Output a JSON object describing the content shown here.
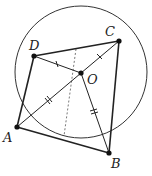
{
  "diagram": {
    "type": "geometry",
    "points": {
      "A": {
        "label": "A",
        "x": 17,
        "y": 127
      },
      "B": {
        "label": "B",
        "x": 109,
        "y": 153
      },
      "C": {
        "label": "C",
        "x": 119,
        "y": 41
      },
      "D": {
        "label": "D",
        "x": 34,
        "y": 56
      },
      "O": {
        "label": "O",
        "x": 81,
        "y": 73
      }
    },
    "circle": {
      "cx": 81,
      "cy": 72,
      "r": 66
    },
    "segments": [
      {
        "from": "A",
        "to": "B",
        "style": "solid"
      },
      {
        "from": "B",
        "to": "C",
        "style": "solid"
      },
      {
        "from": "C",
        "to": "D",
        "style": "solid"
      },
      {
        "from": "D",
        "to": "A",
        "style": "solid"
      },
      {
        "from": "A",
        "to": "C",
        "style": "solid"
      },
      {
        "from": "D",
        "to": "O",
        "style": "solid"
      },
      {
        "from": "O",
        "to": "B",
        "style": "solid"
      },
      {
        "from": "dashed_start",
        "to": "dashed_end",
        "style": "dashed"
      }
    ],
    "tick_marks": [
      {
        "segment": "DO",
        "count": 1
      },
      {
        "segment": "OC",
        "count": 1
      },
      {
        "segment": "AO",
        "count": 2
      },
      {
        "segment": "OB",
        "count": 2
      }
    ],
    "labels": {
      "A": "A",
      "B": "B",
      "C": "C",
      "D": "D",
      "O": "O"
    },
    "colors": {
      "stroke": "#222222",
      "background": "#ffffff"
    }
  }
}
